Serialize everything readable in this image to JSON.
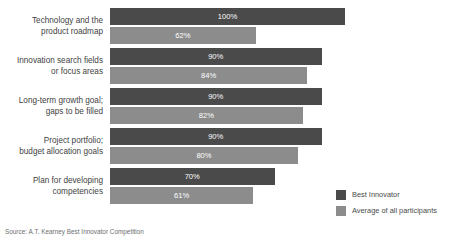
{
  "top_partial_text": "",
  "source_note": "Source: A.T. Kearney Best Innovator Competition",
  "legend": {
    "position": "bottom-right",
    "items": [
      {
        "label": "Best Innovator",
        "color": "#4a4a4a"
      },
      {
        "label": "Average of all participants",
        "color": "#8c8c8c"
      }
    ]
  },
  "chart_data": {
    "type": "bar",
    "orientation": "horizontal",
    "grouped": true,
    "title": "",
    "subtitle": "",
    "xlabel": "",
    "ylabel": "",
    "xlim": [
      0,
      100
    ],
    "grid": false,
    "value_suffix": "%",
    "categories": [
      "Technology and the product roadmap",
      "Innovation search fields or focus areas",
      "Long-term growth goal; gaps to be filled",
      "Project portfolio; budget allocation goals",
      "Plan for developing competencies"
    ],
    "category_lines": [
      [
        "Technology and the",
        "product roadmap"
      ],
      [
        "Innovation search fields",
        "or focus areas"
      ],
      [
        "Long-term growth goal;",
        "gaps to be filled"
      ],
      [
        "Project portfolio;",
        "budget allocation goals"
      ],
      [
        "Plan for developing",
        "competencies"
      ]
    ],
    "series": [
      {
        "name": "Best Innovator",
        "color": "#4a4a4a",
        "values": [
          100,
          90,
          90,
          90,
          70
        ],
        "labels": [
          "100%",
          "90%",
          "90%",
          "90%",
          "70%"
        ]
      },
      {
        "name": "Average of all participants",
        "color": "#8c8c8c",
        "values": [
          62,
          84,
          82,
          80,
          61
        ],
        "labels": [
          "62%",
          "84%",
          "82%",
          "80%",
          "61%"
        ]
      }
    ]
  }
}
